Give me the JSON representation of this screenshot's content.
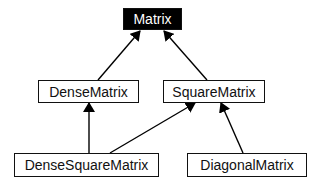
{
  "diagram": {
    "type": "class-hierarchy",
    "nodes": [
      {
        "id": "matrix",
        "label": "Matrix",
        "highlighted": true
      },
      {
        "id": "dense",
        "label": "DenseMatrix"
      },
      {
        "id": "square",
        "label": "SquareMatrix"
      },
      {
        "id": "densesquare",
        "label": "DenseSquareMatrix"
      },
      {
        "id": "diagonal",
        "label": "DiagonalMatrix"
      }
    ],
    "edges": [
      {
        "from": "DenseMatrix",
        "to": "Matrix"
      },
      {
        "from": "SquareMatrix",
        "to": "Matrix"
      },
      {
        "from": "DenseSquareMatrix",
        "to": "DenseMatrix"
      },
      {
        "from": "DenseSquareMatrix",
        "to": "SquareMatrix"
      },
      {
        "from": "DiagonalMatrix",
        "to": "SquareMatrix"
      }
    ]
  }
}
